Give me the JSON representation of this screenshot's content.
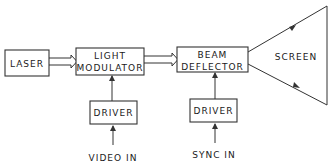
{
  "diagram": {
    "type": "block-diagram",
    "blocks": [
      {
        "id": "laser",
        "label": "LASER"
      },
      {
        "id": "light-modulator",
        "label_line1": "LIGHT",
        "label_line2": "MODULATOR"
      },
      {
        "id": "beam-deflector",
        "label_line1": "BEAM",
        "label_line2": "DEFLECTOR"
      },
      {
        "id": "screen",
        "label": "SCREEN"
      },
      {
        "id": "driver-1",
        "label": "DRIVER"
      },
      {
        "id": "driver-2",
        "label": "DRIVER"
      }
    ],
    "inputs": [
      {
        "id": "video-in",
        "label": "VIDEO IN"
      },
      {
        "id": "sync-in",
        "label": "SYNC IN"
      }
    ],
    "connections": [
      {
        "from": "laser",
        "to": "light-modulator",
        "style": "double-line-arrow"
      },
      {
        "from": "light-modulator",
        "to": "beam-deflector",
        "style": "double-line-arrow"
      },
      {
        "from": "beam-deflector",
        "to": "screen",
        "style": "diverging-beams"
      },
      {
        "from": "driver-1",
        "to": "light-modulator",
        "style": "arrow"
      },
      {
        "from": "video-in",
        "to": "driver-1",
        "style": "arrow"
      },
      {
        "from": "driver-2",
        "to": "beam-deflector",
        "style": "arrow"
      },
      {
        "from": "sync-in",
        "to": "driver-2",
        "style": "arrow"
      }
    ]
  },
  "labels": {
    "laser": "LASER",
    "light": "LIGHT",
    "modulator": "MODULATOR",
    "beam": "BEAM",
    "deflector": "DEFLECTOR",
    "screen": "SCREEN",
    "driver1": "DRIVER",
    "driver2": "DRIVER",
    "video_in": "VIDEO IN",
    "sync_in": "SYNC IN"
  }
}
